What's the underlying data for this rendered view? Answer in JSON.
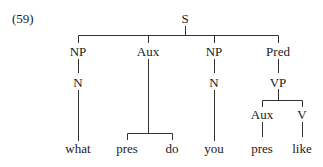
{
  "example_number": "(59)",
  "tree": {
    "root": "S",
    "nodes": {
      "s": "S",
      "np1": "NP",
      "aux1": "Aux",
      "np2": "NP",
      "pred": "Pred",
      "n1": "N",
      "n2": "N",
      "vp": "VP",
      "aux2": "Aux",
      "v": "V"
    },
    "leaves": {
      "what": "what",
      "pres1": "pres",
      "do": "do",
      "you": "you",
      "pres2": "pres",
      "like": "like"
    },
    "structure": "[S [NP [N what]] [Aux pres do] [NP [N you]] [Pred [VP [Aux pres] [V like]]]]"
  },
  "colors": {
    "ink": "#1a1a1a",
    "lines": "#333333",
    "background": "#ffffff"
  }
}
